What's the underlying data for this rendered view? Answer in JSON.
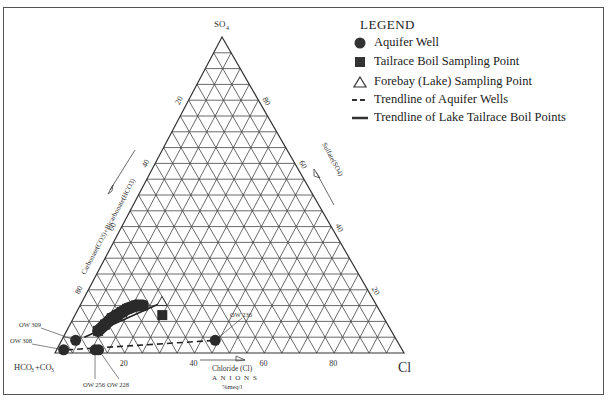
{
  "figure": {
    "apex_top_label": "SO4",
    "bottom_left_label": "HCO3+CO3",
    "bottom_right_label": "Cl",
    "left_axis_title": "Carbonate(CO3)+Bicarbonate(HCO3)",
    "right_axis_title": "Sulfate(SO4)",
    "bottom_axis_title": "Chloride (Cl)",
    "bottom_caption_1": "A N I O N S",
    "bottom_caption_2": "%meq/l"
  },
  "legend": {
    "title": "LEGEND",
    "items": [
      {
        "symbol": "filled-circle",
        "label": "Aquifer Well"
      },
      {
        "symbol": "filled-square",
        "label": "Tailrace Boil Sampling Point"
      },
      {
        "symbol": "open-triangle",
        "label": "Forebay (Lake) Sampling Point"
      },
      {
        "symbol": "dashed-line",
        "label": "Trendline of Aquifer Wells"
      },
      {
        "symbol": "solid-line",
        "label": "Trendline of Lake Tailrace Boil Points"
      }
    ]
  },
  "chart_data": {
    "type": "ternary",
    "title": "",
    "axes": {
      "top": "SO4",
      "left": "HCO3+CO3",
      "right": "Cl"
    },
    "grid_divisions": 20,
    "tick_labels": {
      "bottom_Cl": [
        20,
        40,
        60,
        80
      ],
      "left_HCO3": [
        20,
        40,
        60,
        80
      ],
      "right_SO4": [
        20,
        40,
        60,
        80
      ]
    },
    "point_labels": [
      "OW 309",
      "OW 308",
      "OW 256",
      "OW 228",
      "OW 236"
    ],
    "series": [
      {
        "name": "Aquifer Well",
        "marker": "circle",
        "points": [
          {
            "label": "OW 309",
            "Cl": 4,
            "SO4": 4,
            "HCO3": 92
          },
          {
            "label": "OW 308",
            "Cl": 2,
            "SO4": 1,
            "HCO3": 97
          },
          {
            "label": "OW 256",
            "Cl": 11,
            "SO4": 1,
            "HCO3": 88
          },
          {
            "label": "OW 228",
            "Cl": 12,
            "SO4": 1,
            "HCO3": 87
          },
          {
            "label": "OW 236",
            "Cl": 44,
            "SO4": 4,
            "HCO3": 52
          }
        ]
      },
      {
        "name": "Tailrace Boil Sampling Point",
        "marker": "square",
        "points": [
          {
            "Cl": 9,
            "SO4": 7,
            "HCO3": 84
          },
          {
            "Cl": 10,
            "SO4": 9,
            "HCO3": 81
          },
          {
            "Cl": 11,
            "SO4": 11,
            "HCO3": 78
          },
          {
            "Cl": 12,
            "SO4": 12,
            "HCO3": 76
          },
          {
            "Cl": 13,
            "SO4": 13,
            "HCO3": 74
          },
          {
            "Cl": 14,
            "SO4": 14,
            "HCO3": 72
          },
          {
            "Cl": 16,
            "SO4": 15,
            "HCO3": 69
          },
          {
            "Cl": 18,
            "SO4": 15,
            "HCO3": 67
          },
          {
            "Cl": 25,
            "SO4": 12,
            "HCO3": 63
          }
        ]
      },
      {
        "name": "Forebay (Lake) Sampling Point",
        "marker": "triangle",
        "points": [
          {
            "Cl": 23,
            "SO4": 16,
            "HCO3": 61
          }
        ]
      }
    ],
    "trendlines": [
      {
        "name": "Trendline of Aquifer Wells",
        "style": "dashed",
        "from": {
          "Cl": 3,
          "SO4": 1
        },
        "to": {
          "Cl": 44,
          "SO4": 4
        }
      },
      {
        "name": "Trendline of Lake Tailrace Boil Points",
        "style": "solid",
        "from": {
          "Cl": 6,
          "SO4": 5
        },
        "to": {
          "Cl": 23,
          "SO4": 16
        }
      }
    ]
  }
}
